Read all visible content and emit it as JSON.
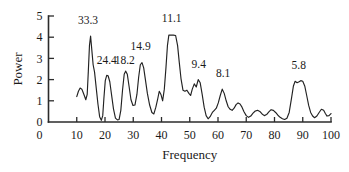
{
  "chart_data": {
    "type": "line",
    "title": "",
    "xlabel": "Frequency",
    "ylabel": "Power",
    "xlim": [
      0,
      100
    ],
    "ylim": [
      0,
      5
    ],
    "grid": false,
    "legend": "none",
    "xticks": [
      0,
      10,
      20,
      30,
      40,
      50,
      60,
      70,
      80,
      90,
      100
    ],
    "xtick_labels": [
      "0",
      "10",
      "20",
      "30",
      "40",
      "50",
      "60",
      "70",
      "80",
      "90",
      "100"
    ],
    "yticks": [
      0,
      1,
      2,
      3,
      4,
      5
    ],
    "ytick_labels": [
      "0",
      "1",
      "2",
      "3",
      "4",
      "5"
    ],
    "series": [
      {
        "name": "power spectrum",
        "color": "#222222",
        "x": [
          10.0,
          10.6,
          11.2,
          11.8,
          12.3,
          12.8,
          13.2,
          13.7,
          14.1,
          14.5,
          14.9,
          15.3,
          15.8,
          16.3,
          16.9,
          17.5,
          18.1,
          18.7,
          19.2,
          19.6,
          20.1,
          20.6,
          21.1,
          21.7,
          22.3,
          23.0,
          23.7,
          24.4,
          25.0,
          25.6,
          26.2,
          26.8,
          27.3,
          27.9,
          28.5,
          29.2,
          29.9,
          30.6,
          31.3,
          31.9,
          32.5,
          33.1,
          33.7,
          34.3,
          35.0,
          35.8,
          36.6,
          37.3,
          38.0,
          38.6,
          39.2,
          39.8,
          40.4,
          41.0,
          41.6,
          42.1,
          42.6,
          43.4,
          44.2,
          45.0,
          45.7,
          46.3,
          46.9,
          47.6,
          48.3,
          49.0,
          49.7,
          50.3,
          50.9,
          51.6,
          52.3,
          53.0,
          53.7,
          54.4,
          55.1,
          55.8,
          56.5,
          57.2,
          58.0,
          58.7,
          59.4,
          60.1,
          60.8,
          61.5,
          62.2,
          62.9,
          63.6,
          64.3,
          65.0,
          65.7,
          66.4,
          67.1,
          67.8,
          68.5,
          69.2,
          70.0,
          70.8,
          71.6,
          72.4,
          73.2,
          74.0,
          74.8,
          75.6,
          76.4,
          77.2,
          78.0,
          78.8,
          79.6,
          80.4,
          81.2,
          82.0,
          82.8,
          83.6,
          84.4,
          85.2,
          86.0,
          86.7,
          87.3,
          88.0,
          88.7,
          89.3,
          90.0,
          90.7,
          91.4,
          92.1,
          92.8,
          93.5,
          94.2,
          95.0,
          95.8,
          96.6,
          97.4,
          98.0,
          98.6,
          99.3,
          100.0
        ],
        "y": [
          1.2,
          1.45,
          1.6,
          1.55,
          1.38,
          1.2,
          1.05,
          1.3,
          2.4,
          3.6,
          4.05,
          3.45,
          2.7,
          2.35,
          1.6,
          0.85,
          0.25,
          0.08,
          0.3,
          1.1,
          1.95,
          2.2,
          2.18,
          1.9,
          1.3,
          0.62,
          0.18,
          0.1,
          0.12,
          0.55,
          1.5,
          2.25,
          2.4,
          2.25,
          1.7,
          1.05,
          0.78,
          0.8,
          1.3,
          2.1,
          2.7,
          2.8,
          2.55,
          2.0,
          1.35,
          0.8,
          0.45,
          0.38,
          0.7,
          1.05,
          1.45,
          1.3,
          1.0,
          1.55,
          2.6,
          3.6,
          4.1,
          4.1,
          4.1,
          4.08,
          3.6,
          2.8,
          2.05,
          1.5,
          1.45,
          1.5,
          1.35,
          1.25,
          1.55,
          1.8,
          1.65,
          2.0,
          1.85,
          1.3,
          0.7,
          0.3,
          0.15,
          0.25,
          0.45,
          0.55,
          0.65,
          0.9,
          1.25,
          1.55,
          1.35,
          1.0,
          0.72,
          0.6,
          0.55,
          0.65,
          0.82,
          0.9,
          0.85,
          0.7,
          0.48,
          0.3,
          0.22,
          0.28,
          0.42,
          0.52,
          0.55,
          0.5,
          0.38,
          0.3,
          0.35,
          0.48,
          0.58,
          0.55,
          0.45,
          0.32,
          0.22,
          0.15,
          0.12,
          0.18,
          0.45,
          1.1,
          1.7,
          1.92,
          1.85,
          1.9,
          1.95,
          1.92,
          1.7,
          1.25,
          0.78,
          0.45,
          0.28,
          0.2,
          0.28,
          0.45,
          0.6,
          0.55,
          0.4,
          0.28,
          0.3,
          0.4
        ]
      }
    ],
    "annotations": [
      {
        "label": "33.3",
        "x": 14.5,
        "y": 4.05,
        "label_x": 14.0,
        "label_y": 4.62
      },
      {
        "label": "24.4",
        "x": 20.6,
        "y": 2.2,
        "label_x": 20.6,
        "label_y": 2.72
      },
      {
        "label": "18.2",
        "x": 27.3,
        "y": 2.4,
        "label_x": 27.0,
        "label_y": 2.72
      },
      {
        "label": "14.9",
        "x": 33.1,
        "y": 2.8,
        "label_x": 32.6,
        "label_y": 3.38
      },
      {
        "label": "11.1",
        "x": 43.4,
        "y": 4.1,
        "label_x": 43.6,
        "label_y": 4.72
      },
      {
        "label": "9.4",
        "x": 53.0,
        "y": 2.0,
        "label_x": 53.2,
        "label_y": 2.55
      },
      {
        "label": "8.1",
        "x": 61.5,
        "y": 1.55,
        "label_x": 61.8,
        "label_y": 2.12
      },
      {
        "label": "5.8",
        "x": 89.3,
        "y": 1.95,
        "label_x": 88.6,
        "label_y": 2.52
      }
    ]
  }
}
